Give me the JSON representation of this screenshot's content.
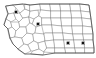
{
  "figure": {
    "kind": "choropleth-outline-map",
    "title": "",
    "region_name": "Montana",
    "background_color": "#ffffff",
    "county_line_color": "#8d8d8d",
    "state_outline_color": "#4a4a4a",
    "marker_color": "#111111",
    "marker_shape": "square",
    "marker_count": 4,
    "width_px": 96,
    "height_px": 58
  },
  "chart_data": {
    "type": "scatter",
    "title": "",
    "xlabel": "",
    "ylabel": "",
    "xlim": [
      0,
      96
    ],
    "ylim": [
      0,
      58
    ],
    "grid": false,
    "legend": "none",
    "series": [
      {
        "name": "Sites",
        "marker": "square",
        "color": "#111111",
        "points": [
          {
            "label": "site-1",
            "x": 16,
            "y": 12
          },
          {
            "label": "site-2",
            "x": 38,
            "y": 24
          },
          {
            "label": "site-3",
            "x": 68,
            "y": 43
          },
          {
            "label": "site-4",
            "x": 83,
            "y": 43
          }
        ]
      }
    ]
  },
  "markers": [
    {
      "name": "marker-1",
      "cx": 16,
      "cy": 12,
      "size": 3.4
    },
    {
      "name": "marker-2",
      "cx": 38,
      "cy": 24,
      "size": 3.4
    },
    {
      "name": "marker-3",
      "cx": 68,
      "cy": 43,
      "size": 3.4
    },
    {
      "name": "marker-4",
      "cx": 83,
      "cy": 43,
      "size": 3.4
    }
  ]
}
